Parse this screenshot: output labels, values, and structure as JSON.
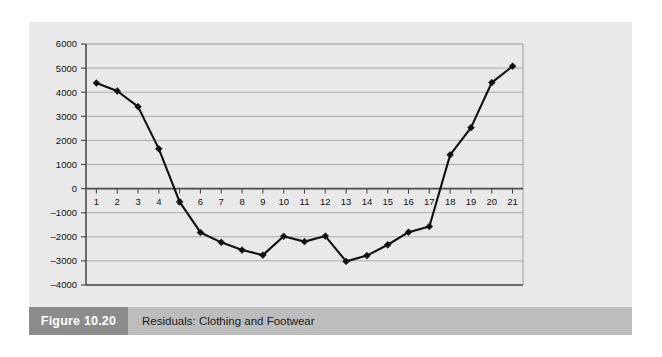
{
  "figure": {
    "number_label": "Figure 10.20",
    "title": "Residuals: Clothing and Footwear"
  },
  "colors": {
    "page_background": "#ffffff",
    "panel_background": "#e9e9e9",
    "caption_bar": "#bdbdbd",
    "caption_number_box": "#8c8c8c",
    "caption_number_text": "#ffffff",
    "gridline": "#9a9a9a",
    "axis_line": "#4d4d4d",
    "series_line": "#111111",
    "marker": "#111111"
  },
  "chart_data": {
    "type": "line",
    "title": "Residuals: Clothing and Footwear",
    "xlabel": "",
    "ylabel": "",
    "x": [
      1,
      2,
      3,
      4,
      5,
      6,
      7,
      8,
      9,
      10,
      11,
      12,
      13,
      14,
      15,
      16,
      17,
      18,
      19,
      20,
      21
    ],
    "categories": [
      "1",
      "2",
      "3",
      "4",
      "5",
      "6",
      "7",
      "8",
      "9",
      "10",
      "11",
      "12",
      "13",
      "14",
      "15",
      "16",
      "17",
      "18",
      "19",
      "20",
      "21"
    ],
    "values": [
      4380,
      4050,
      3400,
      1650,
      -550,
      -1820,
      -2230,
      -2550,
      -2760,
      -1980,
      -2200,
      -1970,
      -3020,
      -2780,
      -2330,
      -1810,
      -1570,
      1400,
      2530,
      4400,
      5080
    ],
    "series": [
      {
        "name": "Residuals",
        "values": [
          4380,
          4050,
          3400,
          1650,
          -550,
          -1820,
          -2230,
          -2550,
          -2760,
          -1980,
          -2200,
          -1970,
          -3020,
          -2780,
          -2330,
          -1810,
          -1570,
          1400,
          2530,
          4400,
          5080
        ]
      }
    ],
    "ylim": [
      -4000,
      6000
    ],
    "xlim": [
      0.5,
      21.5
    ],
    "yticks": [
      6000,
      5000,
      4000,
      3000,
      2000,
      1000,
      0,
      -1000,
      -2000,
      -3000,
      -4000
    ],
    "ytick_labels": [
      "6000",
      "5000",
      "4000",
      "3000",
      "2000",
      "1000",
      "0",
      "–1000",
      "–2000",
      "–3000",
      "–4000"
    ],
    "xticks": [
      1,
      2,
      3,
      4,
      5,
      6,
      7,
      8,
      9,
      10,
      11,
      12,
      13,
      14,
      15,
      16,
      17,
      18,
      19,
      20,
      21
    ],
    "xtick_labels": [
      "1",
      "2",
      "3",
      "4",
      "5",
      "6",
      "7",
      "8",
      "9",
      "10",
      "11",
      "12",
      "13",
      "14",
      "15",
      "16",
      "17",
      "18",
      "19",
      "20",
      "21"
    ],
    "grid": true,
    "grid_axis": "y",
    "legend": false,
    "legend_position": "none",
    "marker": "diamond",
    "zero_line": 0
  }
}
